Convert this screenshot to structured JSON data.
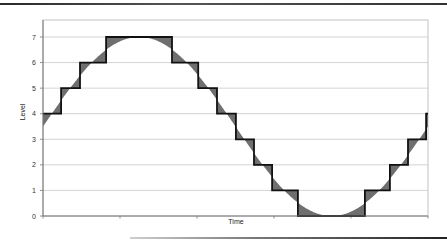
{
  "chart_data": {
    "type": "line",
    "title": "",
    "xlabel": "Time",
    "ylabel": "Level",
    "ylim": [
      0,
      7
    ],
    "yticks": [
      0,
      1,
      2,
      3,
      4,
      5,
      6,
      7
    ],
    "grid": true,
    "legend": null,
    "series": [
      {
        "name": "Analog signal (sine)",
        "style": "smooth curve, area between curve and steps shaded gray",
        "description": "one full sine cycle, centered at 3.5, amplitude 3.5, starting at ~3.5 rising",
        "x": [
          0,
          0.05,
          0.1,
          0.15,
          0.2,
          0.25,
          0.3,
          0.35,
          0.4,
          0.45,
          0.5,
          0.55,
          0.6,
          0.65,
          0.7,
          0.75,
          0.8,
          0.85,
          0.9,
          0.95,
          1.0
        ],
        "values": [
          3.5,
          4.58,
          5.56,
          6.33,
          6.83,
          7.0,
          6.83,
          6.33,
          5.56,
          4.58,
          3.5,
          2.42,
          1.44,
          0.67,
          0.17,
          0.0,
          0.17,
          0.67,
          1.44,
          2.42,
          3.5
        ]
      },
      {
        "name": "Quantized signal (steps)",
        "style": "black step line",
        "steps": [
          {
            "x_start": 0.0,
            "x_end": 0.047,
            "level": 4
          },
          {
            "x_start": 0.047,
            "x_end": 0.096,
            "level": 5
          },
          {
            "x_start": 0.096,
            "x_end": 0.164,
            "level": 6
          },
          {
            "x_start": 0.164,
            "x_end": 0.335,
            "level": 7
          },
          {
            "x_start": 0.335,
            "x_end": 0.403,
            "level": 6
          },
          {
            "x_start": 0.403,
            "x_end": 0.452,
            "level": 5
          },
          {
            "x_start": 0.452,
            "x_end": 0.501,
            "level": 4
          },
          {
            "x_start": 0.501,
            "x_end": 0.548,
            "level": 3
          },
          {
            "x_start": 0.548,
            "x_end": 0.595,
            "level": 2
          },
          {
            "x_start": 0.595,
            "x_end": 0.662,
            "level": 1
          },
          {
            "x_start": 0.662,
            "x_end": 0.836,
            "level": 0
          },
          {
            "x_start": 0.836,
            "x_end": 0.901,
            "level": 1
          },
          {
            "x_start": 0.901,
            "x_end": 0.948,
            "level": 2
          },
          {
            "x_start": 0.948,
            "x_end": 0.995,
            "level": 3
          },
          {
            "x_start": 0.995,
            "x_end": 1.0,
            "level": 4
          }
        ]
      }
    ]
  },
  "axes": {
    "x_title": "Time",
    "y_title": "Level",
    "y_tick_labels": [
      "0",
      "1",
      "2",
      "3",
      "4",
      "5",
      "6",
      "7"
    ]
  },
  "colors": {
    "step_line": "#111111",
    "fill": "#6f6f6f",
    "grid": "#c8c8c8",
    "axis": "#777777"
  }
}
